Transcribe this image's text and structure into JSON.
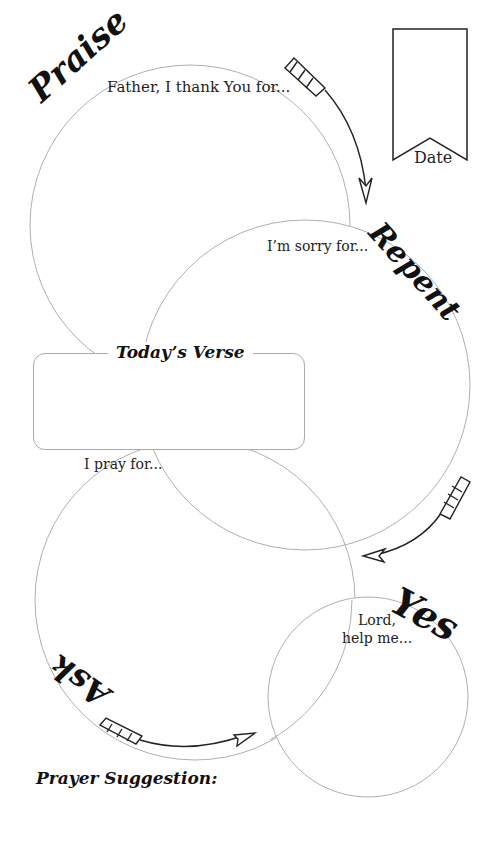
{
  "sections": {
    "praise": {
      "title": "Praise",
      "prompt": "Father, I thank You for..."
    },
    "repent": {
      "title": "Repent",
      "prompt": "I’m sorry for..."
    },
    "ask": {
      "title": "Ask",
      "prompt": "I pray for..."
    },
    "yes": {
      "title": "Yes",
      "prompt_line1": "Lord,",
      "prompt_line2": "help me..."
    }
  },
  "verse": {
    "title": "Today’s Verse"
  },
  "date": {
    "label": "Date"
  },
  "footer": {
    "prayer_suggestion": "Prayer Suggestion:"
  },
  "colors": {
    "circle_stroke": "#b0b0b0",
    "ink": "#111111"
  }
}
